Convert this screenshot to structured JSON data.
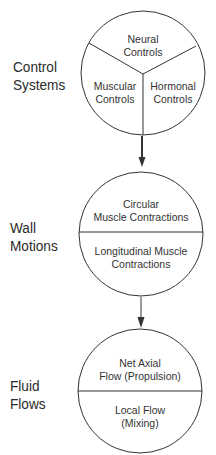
{
  "diagram": {
    "stages": [
      {
        "label_line1": "Control",
        "label_line2": "Systems",
        "segments": [
          {
            "line1": "Neural",
            "line2": "Controls"
          },
          {
            "line1": "Muscular",
            "line2": "Controls"
          },
          {
            "line1": "Hormonal",
            "line2": "Controls"
          }
        ]
      },
      {
        "label_line1": "Wall",
        "label_line2": "Motions",
        "segments": [
          {
            "line1": "Circular",
            "line2": "Muscle Contractions"
          },
          {
            "line1": "Longitudinal Muscle",
            "line2": "Contractions"
          }
        ]
      },
      {
        "label_line1": "Fluid",
        "label_line2": "Flows",
        "segments": [
          {
            "line1": "Net Axial",
            "line2": "Flow (Propulsion)"
          },
          {
            "line1": "Local Flow",
            "line2": "(Mixing)"
          }
        ]
      }
    ],
    "colors": {
      "line": "#333333",
      "text": "#2a2a2a",
      "background": "#ffffff"
    }
  }
}
